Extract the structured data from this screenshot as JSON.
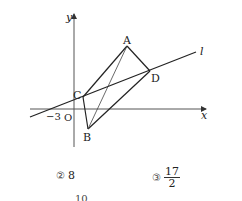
{
  "figure": {
    "axes": {
      "x_label": "x",
      "y_label": "y",
      "origin_label": "O",
      "x_tick_label": "−3"
    },
    "line": {
      "label": "l"
    },
    "points": {
      "A": {
        "label": "A",
        "px": [
          127,
          46
        ]
      },
      "B": {
        "label": "B",
        "px": [
          88,
          129
        ]
      },
      "C": {
        "label": "C",
        "px": [
          83,
          97
        ]
      },
      "D": {
        "label": "D",
        "px": [
          150,
          71
        ]
      }
    },
    "segments": [
      "AC",
      "AD",
      "CB",
      "BD",
      "AB"
    ],
    "line_l_endpoints_px": [
      [
        30,
        117
      ],
      [
        196,
        52
      ]
    ]
  },
  "choices": [
    {
      "marker": "②",
      "value": "8"
    },
    {
      "marker": "③",
      "numerator": "17",
      "denominator": "2"
    }
  ],
  "cut_text": "10"
}
